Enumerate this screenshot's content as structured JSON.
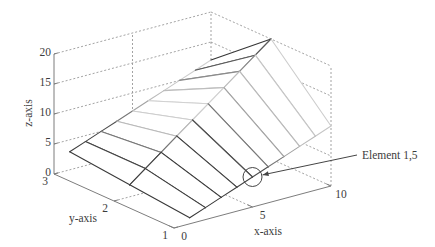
{
  "colors": {
    "axis_line": "#7d7d7d",
    "grid_line": "#8c8c8c",
    "text": "#3c3c3c",
    "annotation": "#454545",
    "face": "#ffffff"
  },
  "chart_data": {
    "type": "mesh",
    "title": "",
    "xlabel": "x-axis",
    "ylabel": "y-axis",
    "zlabel": "z-axis",
    "xlim": [
      0,
      10
    ],
    "ylim": [
      1,
      3
    ],
    "zlim": [
      0,
      20
    ],
    "xticks": [
      0,
      5,
      10
    ],
    "yticks": [
      1,
      2,
      3
    ],
    "zticks": [
      0,
      5,
      10,
      15,
      20
    ],
    "grid": true,
    "x": [
      1,
      2,
      3,
      4,
      5,
      6,
      7,
      8,
      9,
      10
    ],
    "y": [
      1,
      2,
      3
    ],
    "Z": [
      [
        1,
        2,
        3,
        4,
        5,
        6,
        7,
        8,
        9,
        10
      ],
      [
        2,
        4,
        6,
        8,
        10,
        12,
        14,
        16,
        18,
        20
      ],
      [
        3,
        4,
        5,
        6,
        7,
        8,
        9,
        10,
        11,
        12
      ]
    ],
    "edge_colormap": [
      "#383838",
      "#3a3a3a",
      "#3d3d3d",
      "#444444",
      "#4e4e4e",
      "#777777",
      "#a3a3a3",
      "#bababa",
      "#c6c6c6",
      "#cdcdcd",
      "#d1d1d1",
      "#d1d1d1",
      "#cbcbcb",
      "#bdbdbd",
      "#a8a8a8",
      "#8c8c8c",
      "#727272",
      "#5a5a5a",
      "#464646",
      "#363636"
    ],
    "annotations": [
      {
        "text": "Element 1,5",
        "row": 1,
        "col": 5,
        "x": 5,
        "y": 1,
        "z": 5,
        "marker": "circle",
        "arrow": true
      }
    ]
  }
}
